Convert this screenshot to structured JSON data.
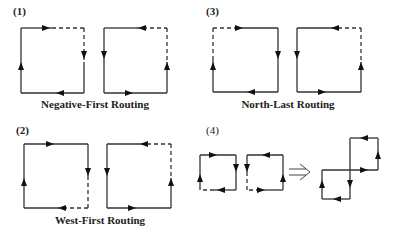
{
  "colors": {
    "line": "#333333",
    "background": "#ffffff"
  },
  "panels": [
    {
      "id": "1",
      "label": "(1)",
      "caption": "Negative-First Routing"
    },
    {
      "id": "3",
      "label": "(3)",
      "caption": "North-Last Routing"
    },
    {
      "id": "2",
      "label": "(2)",
      "caption": "West-First Routing"
    },
    {
      "id": "4",
      "label": "(4)",
      "caption": ""
    }
  ],
  "symbols": {
    "implies": "⇒"
  }
}
